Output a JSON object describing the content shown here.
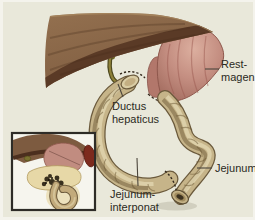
{
  "figure_type": "surgical-anatomy-illustration",
  "labels": {
    "rest_magen": "Rest-\nmagen",
    "ductus_hepaticus": "Ductus\nhepaticus",
    "jejunum": "Jejunum",
    "jejunum_interponat": "Jejunum-\ninterponat"
  },
  "colors": {
    "background": "#e9e8da",
    "frame": "#f4f3ec",
    "liver": "#87654a",
    "liver_underside": "#5a3a26",
    "stomach": "#c48e81",
    "hepatic_duct": "#8e8139",
    "bowel": "#c6b489",
    "bowel_outline": "#6b5a3c",
    "spleen": "#7d2a1d",
    "pancreas": "#e7d8a7",
    "tumor": "#39301e",
    "inset_border": "#2e2c27",
    "label_text": "#2b2a22",
    "leader_line": "#4c463c"
  }
}
